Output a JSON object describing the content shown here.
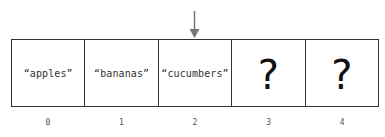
{
  "pointer": {
    "icon": "down-arrow-icon",
    "target_index": 2,
    "color": "#777777"
  },
  "array": {
    "cells": [
      {
        "value": "“apples”",
        "known": true
      },
      {
        "value": "“bananas”",
        "known": true
      },
      {
        "value": "“cucumbers”",
        "known": true
      },
      {
        "value": "?",
        "known": false
      },
      {
        "value": "?",
        "known": false
      }
    ],
    "indices": [
      "0",
      "1",
      "2",
      "3",
      "4"
    ],
    "border_color": "#333333"
  }
}
